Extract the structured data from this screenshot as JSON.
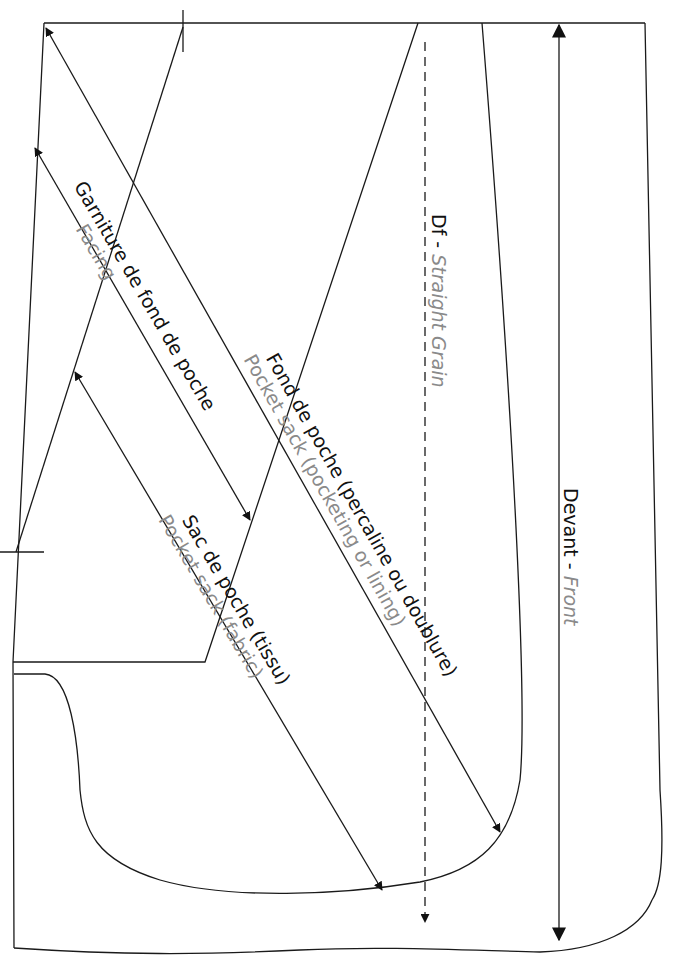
{
  "diagram": {
    "colors": {
      "line": "#1a1a1a",
      "label_fr": "#111111",
      "label_en": "#8a8a8a",
      "background": "#ffffff"
    },
    "labels": {
      "facing": {
        "fr": "Garniture de fond de poche",
        "en": "Facing"
      },
      "pocket_lining": {
        "fr": "Fond de poche (percaline ou doublure)",
        "en": "Pocket sack (pocketing or lining)"
      },
      "pocket_fabric": {
        "fr": "Sac de poche (tissu)",
        "en": "Pocket sack (fabric)"
      },
      "grain": {
        "fr": "Df - ",
        "en": "Straight Grain"
      },
      "front": {
        "fr": "Devant - ",
        "en": "Front"
      }
    },
    "arrows": [
      {
        "name": "facing-arrow",
        "from": [
          35,
          148
        ],
        "to": [
          250,
          520
        ],
        "heads": "both"
      },
      {
        "name": "pocket-lining-arrow",
        "from": [
          46,
          28
        ],
        "to": [
          500,
          830
        ],
        "heads": "both"
      },
      {
        "name": "pocket-fabric-arrow",
        "from": [
          75,
          370
        ],
        "to": [
          382,
          890
        ],
        "heads": "both"
      },
      {
        "name": "straight-grain-line",
        "from": [
          425,
          42
        ],
        "to": [
          425,
          922
        ],
        "style": "dashed",
        "heads": "end"
      },
      {
        "name": "front-arrow",
        "from": [
          559,
          25
        ],
        "to": [
          559,
          940
        ],
        "heads": "both"
      }
    ]
  }
}
